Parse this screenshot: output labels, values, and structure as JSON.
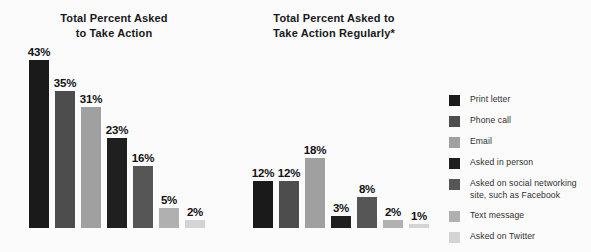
{
  "background_color": "#fbfbfb",
  "chart_data": {
    "type": "bar",
    "title": "",
    "panels": [
      {
        "title": "Total Percent Asked\nto Take Action",
        "categories": [
          "Print letter",
          "Phone call",
          "Email",
          "Asked in person",
          "Asked on social networking site, such as Facebook",
          "Text message",
          "Asked on Twitter"
        ],
        "values": [
          43,
          35,
          31,
          23,
          16,
          5,
          2
        ],
        "labels": [
          "43%",
          "35%",
          "31%",
          "23%",
          "16%",
          "5%",
          "2%"
        ],
        "ylim": [
          0,
          43
        ],
        "ylabel": "",
        "xlabel": "",
        "grid": false
      },
      {
        "title": "Total Percent Asked to\nTake Action Regularly*",
        "categories": [
          "Print letter",
          "Phone call",
          "Email",
          "Asked in person",
          "Asked on social networking site, such as Facebook",
          "Text message",
          "Asked on Twitter"
        ],
        "values": [
          12,
          12,
          18,
          3,
          8,
          2,
          1
        ],
        "labels": [
          "12%",
          "12%",
          "18%",
          "3%",
          "8%",
          "2%",
          "1%"
        ],
        "ylim": [
          0,
          43
        ],
        "ylabel": "",
        "xlabel": "",
        "grid": false
      }
    ],
    "legend_position": "right",
    "series_colors": [
      "#1a1a1a",
      "#4d4d4d",
      "#a0a0a0",
      "#1f1f1f",
      "#565656",
      "#b0b0b0",
      "#d4d4d4"
    ]
  },
  "legend": {
    "items": [
      {
        "label": "Print letter",
        "color": "#1a1a1a"
      },
      {
        "label": "Phone call",
        "color": "#4d4d4d"
      },
      {
        "label": "Email",
        "color": "#a0a0a0"
      },
      {
        "label": "Asked in person",
        "color": "#1f1f1f"
      },
      {
        "label": "Asked on social networking\nsite, such as Facebook",
        "color": "#565656"
      },
      {
        "label": "Text message",
        "color": "#b0b0b0"
      },
      {
        "label": "Asked on Twitter",
        "color": "#d4d4d4"
      }
    ]
  }
}
